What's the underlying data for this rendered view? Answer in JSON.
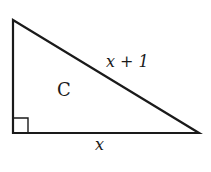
{
  "diagram": {
    "type": "right-triangle",
    "region_label": "C",
    "hypotenuse_label": "x + 1",
    "base_label": "x",
    "right_angle_marker": "bottom-left",
    "colors": {
      "stroke": "#1a1a1a",
      "background": "#ffffff"
    }
  }
}
